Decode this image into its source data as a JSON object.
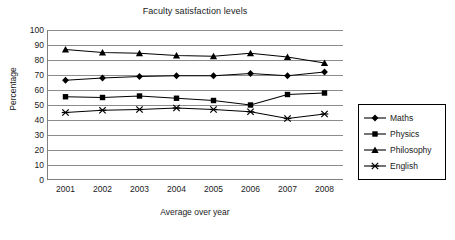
{
  "chart_data": {
    "type": "line",
    "title": "Faculty satisfaction levels",
    "xlabel": "Average over year",
    "ylabel": "Percentage",
    "categories": [
      "2001",
      "2002",
      "2003",
      "2004",
      "2005",
      "2006",
      "2007",
      "2008"
    ],
    "ylim": [
      0,
      100
    ],
    "yticks": [
      "0",
      "10",
      "20",
      "30",
      "40",
      "50",
      "60",
      "70",
      "80",
      "90",
      "100"
    ],
    "grid": "horizontal",
    "legend_position": "right",
    "series": [
      {
        "name": "Maths",
        "marker": "diamond",
        "values": [
          66.5,
          68,
          69,
          69.5,
          69.5,
          71,
          69.5,
          72
        ]
      },
      {
        "name": "Physics",
        "marker": "square",
        "values": [
          55.5,
          55,
          56,
          54.5,
          53,
          50,
          57,
          58
        ]
      },
      {
        "name": "Philosophy",
        "marker": "triangle",
        "values": [
          87,
          85,
          84.5,
          83,
          82.5,
          84.5,
          82,
          78
        ]
      },
      {
        "name": "English",
        "marker": "star",
        "values": [
          45,
          46.5,
          47,
          48,
          47,
          45.5,
          41,
          44
        ]
      }
    ]
  },
  "style": {
    "line_color": "#000000",
    "grid_color": "#8c8c8c",
    "axis_color": "#808080",
    "text_color": "#1a1a1a",
    "background": "#ffffff"
  },
  "legend": {
    "items": [
      {
        "label": "Maths",
        "icon": "diamond-marker-icon"
      },
      {
        "label": "Physics",
        "icon": "square-marker-icon"
      },
      {
        "label": "Philosophy",
        "icon": "triangle-marker-icon"
      },
      {
        "label": "English",
        "icon": "star-marker-icon"
      }
    ]
  }
}
